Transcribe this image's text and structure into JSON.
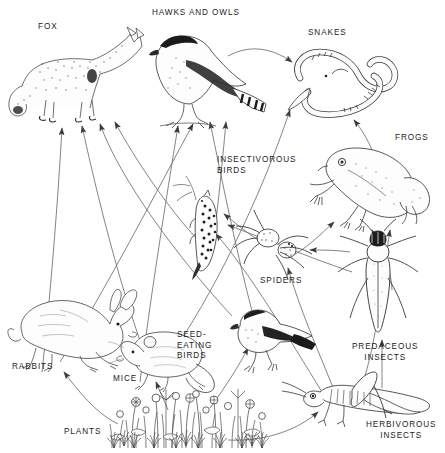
{
  "diagram": {
    "type": "food-web",
    "style": "pen-and-ink stipple illustration, thin gray curved arrows",
    "background_color": "#ffffff",
    "line_color": "#6b6b6b",
    "arrowhead_color": "#3a3a3a",
    "text_color": "#1c1c1c",
    "canvas": {
      "width": 445,
      "height": 453
    }
  },
  "labels": {
    "fox": "FOX",
    "hawks_and_owls": "HAWKS AND OWLS",
    "snakes": "SNAKES",
    "frogs": "FROGS",
    "insectivorous_birds": "INSECTIVOROUS\nBIRDS",
    "spiders": "SPIDERS",
    "predaceous_insects": "PREDACEOUS\nINSECTS",
    "herbivorous_insects": "HERBIVOROUS\nINSECTS",
    "seed_eating_birds": "SEED-\nEATING\nBIRDS",
    "rabbits": "RABBITS",
    "mice": "MICE",
    "plants": "PLANTS"
  },
  "nodes": [
    {
      "id": "fox",
      "label": "FOX",
      "trophic": "predator",
      "label_x": 40,
      "label_y": 26,
      "art_x": 8,
      "art_y": 28,
      "art_w": 120,
      "art_h": 92
    },
    {
      "id": "hawks_and_owls",
      "label": "HAWKS AND OWLS",
      "trophic": "predator",
      "label_x": 155,
      "label_y": 12,
      "art_x": 140,
      "art_y": 26,
      "art_w": 125,
      "art_h": 100
    },
    {
      "id": "snakes",
      "label": "SNAKES",
      "trophic": "predator",
      "label_x": 310,
      "label_y": 33,
      "art_x": 288,
      "art_y": 48,
      "art_w": 110,
      "art_h": 75
    },
    {
      "id": "frogs",
      "label": "FROGS",
      "trophic": "predator",
      "label_x": 397,
      "label_y": 139,
      "art_x": 318,
      "art_y": 145,
      "art_w": 110,
      "art_h": 85
    },
    {
      "id": "insectivorous_birds",
      "label": "INSECTIVOROUS BIRDS",
      "trophic": "secondary",
      "label_x": 219,
      "label_y": 159,
      "art_x": 182,
      "art_y": 188,
      "art_w": 56,
      "art_h": 82
    },
    {
      "id": "spiders",
      "label": "SPIDERS",
      "trophic": "secondary",
      "label_x": 262,
      "label_y": 280,
      "art_x": 253,
      "art_y": 225,
      "art_w": 68,
      "art_h": 55
    },
    {
      "id": "predaceous_insects",
      "label": "PREDACEOUS INSECTS",
      "trophic": "secondary",
      "label_x": 356,
      "label_y": 347,
      "art_x": 349,
      "art_y": 232,
      "art_w": 78,
      "art_h": 110
    },
    {
      "id": "seed_eating_birds",
      "label": "SEED-EATING BIRDS",
      "trophic": "primary",
      "label_x": 177,
      "label_y": 335,
      "art_x": 228,
      "art_y": 308,
      "art_w": 88,
      "art_h": 62
    },
    {
      "id": "rabbits",
      "label": "RABBITS",
      "trophic": "primary",
      "label_x": 13,
      "label_y": 367,
      "art_x": 10,
      "art_y": 292,
      "art_w": 118,
      "art_h": 78
    },
    {
      "id": "mice",
      "label": "MICE",
      "trophic": "primary",
      "label_x": 115,
      "label_y": 378,
      "art_x": 124,
      "art_y": 322,
      "art_w": 94,
      "art_h": 62
    },
    {
      "id": "herbivorous_insects",
      "label": "HERBIVOROUS INSECTS",
      "trophic": "primary",
      "label_x": 369,
      "label_y": 425,
      "art_x": 300,
      "art_y": 378,
      "art_w": 140,
      "art_h": 46
    },
    {
      "id": "plants",
      "label": "PLANTS",
      "trophic": "producer",
      "label_x": 66,
      "label_y": 431,
      "art_x": 108,
      "art_y": 392,
      "art_w": 165,
      "art_h": 58
    }
  ],
  "links": [
    {
      "from": "rabbits",
      "to": "fox"
    },
    {
      "from": "mice",
      "to": "fox"
    },
    {
      "from": "seed_eating_birds",
      "to": "fox"
    },
    {
      "from": "insectivorous_birds",
      "to": "fox"
    },
    {
      "from": "mice",
      "to": "hawks_and_owls"
    },
    {
      "from": "rabbits",
      "to": "hawks_and_owls"
    },
    {
      "from": "seed_eating_birds",
      "to": "hawks_and_owls"
    },
    {
      "from": "insectivorous_birds",
      "to": "hawks_and_owls"
    },
    {
      "from": "hawks_and_owls",
      "to": "snakes"
    },
    {
      "from": "mice",
      "to": "snakes"
    },
    {
      "from": "frogs",
      "to": "snakes"
    },
    {
      "from": "herbivorous_insects",
      "to": "frogs"
    },
    {
      "from": "spiders",
      "to": "frogs"
    },
    {
      "from": "predaceous_insects",
      "to": "frogs"
    },
    {
      "from": "spiders",
      "to": "insectivorous_birds"
    },
    {
      "from": "herbivorous_insects",
      "to": "insectivorous_birds"
    },
    {
      "from": "predaceous_insects",
      "to": "insectivorous_birds"
    },
    {
      "from": "herbivorous_insects",
      "to": "spiders"
    },
    {
      "from": "predaceous_insects",
      "to": "spiders"
    },
    {
      "from": "herbivorous_insects",
      "to": "predaceous_insects"
    },
    {
      "from": "plants",
      "to": "seed_eating_birds"
    },
    {
      "from": "plants",
      "to": "rabbits"
    },
    {
      "from": "plants",
      "to": "mice"
    },
    {
      "from": "plants",
      "to": "herbivorous_insects"
    }
  ]
}
